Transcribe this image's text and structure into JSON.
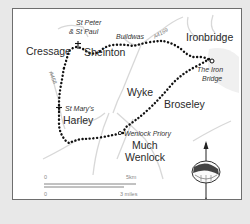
{
  "map": {
    "towns": {
      "cressage": "Cressage",
      "sheinton": "Sheinton",
      "ironbridge": "Ironbridge",
      "wyke": "Wyke",
      "broseley": "Broseley",
      "harley": "Harley",
      "much": "Much",
      "wenlock": "Wenlock"
    },
    "poi": {
      "st_peter_1": "St Peter",
      "st_peter_2": "& St Paul",
      "iron_bridge_1": "The Iron",
      "iron_bridge_2": "Bridge",
      "st_marys": "St Mary's",
      "wenlock_priory": "Wenlock Priory"
    },
    "roads": {
      "buildwas": "Buildwas",
      "a4169": "A4169",
      "a458": "A458"
    },
    "scale": {
      "km_start": "0",
      "km_end": "5km",
      "mi_start": "0",
      "mi_end": "3 miles"
    },
    "compass": {
      "label": "N"
    },
    "colors": {
      "route": "#111111",
      "roads": "#d6d6d6",
      "frame_border": "#6e6e6e",
      "background": "#e8e8e8"
    }
  }
}
